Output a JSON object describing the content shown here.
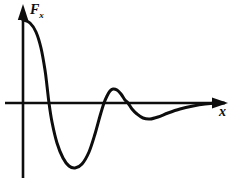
{
  "figure": {
    "kind": "line-plot",
    "background_color": "#ffffff",
    "ink_color": "#0d0d0d",
    "y_axis_label_main": "F",
    "y_axis_label_sub": "x",
    "x_axis_label": "x"
  },
  "chart_data": {
    "type": "line",
    "title": "",
    "xlabel": "x",
    "ylabel": "Fₓ",
    "grid": false,
    "legend": null,
    "axes": {
      "x_axis_y_pixel": 103,
      "y_axis_x_pixel": 23,
      "x_axis_start_pixel": 5,
      "x_axis_arrow_tip_pixel": 228,
      "y_axis_arrow_tip_pixel": 5,
      "y_axis_bottom_pixel": 178,
      "x_arrow": true,
      "y_arrow": true,
      "ticks": [],
      "tick_labels": []
    },
    "series": [
      {
        "name": "F_x(x)",
        "stroke": "#0d0d0d",
        "points_pixel": [
          [
            23,
            20
          ],
          [
            30,
            23
          ],
          [
            36,
            32
          ],
          [
            41,
            48
          ],
          [
            45,
            70
          ],
          [
            47,
            86
          ],
          [
            49,
            103
          ],
          [
            52,
            122
          ],
          [
            57,
            143
          ],
          [
            63,
            158
          ],
          [
            69,
            166
          ],
          [
            75,
            168
          ],
          [
            82,
            164
          ],
          [
            89,
            152
          ],
          [
            95,
            134
          ],
          [
            100,
            116
          ],
          [
            104,
            103
          ],
          [
            107,
            96
          ],
          [
            110,
            91
          ],
          [
            113,
            89
          ],
          [
            117,
            90
          ],
          [
            121,
            94
          ],
          [
            125,
            100
          ],
          [
            128,
            103
          ],
          [
            132,
            109
          ],
          [
            137,
            114
          ],
          [
            143,
            118
          ],
          [
            150,
            119
          ],
          [
            158,
            117
          ],
          [
            168,
            113
          ],
          [
            180,
            109
          ],
          [
            193,
            106
          ],
          [
            205,
            104
          ],
          [
            216,
            103
          ],
          [
            224,
            103
          ]
        ],
        "zero_crossings_pixel": [
          49,
          104,
          128,
          212
        ],
        "extrema_pixel": [
          {
            "type": "start-maximum",
            "x": 23,
            "y": 20
          },
          {
            "type": "minimum",
            "x": 75,
            "y": 168
          },
          {
            "type": "maximum",
            "x": 113,
            "y": 89
          },
          {
            "type": "minimum",
            "x": 148,
            "y": 119
          }
        ]
      }
    ]
  }
}
